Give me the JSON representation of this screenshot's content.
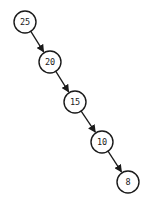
{
  "diagram": {
    "type": "binary-search-tree",
    "nodes": [
      {
        "id": "n25",
        "label": "25",
        "cx": 25,
        "cy": 22
      },
      {
        "id": "n20",
        "label": "20",
        "cx": 50,
        "cy": 62
      },
      {
        "id": "n15",
        "label": "15",
        "cx": 75,
        "cy": 102
      },
      {
        "id": "n10",
        "label": "10",
        "cx": 102,
        "cy": 142
      },
      {
        "id": "n8",
        "label": "8",
        "cx": 128,
        "cy": 182
      }
    ],
    "edges": [
      {
        "from": "25",
        "to": "20"
      },
      {
        "from": "20",
        "to": "15"
      },
      {
        "from": "15",
        "to": "10"
      },
      {
        "from": "10",
        "to": "8"
      }
    ],
    "node_radius": 11,
    "colors": {
      "stroke": "#1a1a1a",
      "fill": "#ffffff",
      "background": "#ffffff"
    }
  }
}
